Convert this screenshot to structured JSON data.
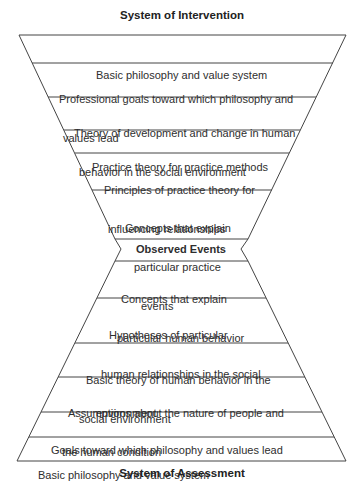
{
  "top_title": "System of Intervention",
  "bottom_title": "System of Assessment",
  "center_label": "Observed Events",
  "intervention_levels": [
    {
      "lines": [
        "Basic philosophy and value system"
      ]
    },
    {
      "lines": [
        "Professional goals toward which philosophy and",
        "values lead"
      ]
    },
    {
      "lines": [
        "Theory of development and change in human",
        "behavior in the social environment"
      ]
    },
    {
      "lines": [
        "Practice theory for practice methods"
      ]
    },
    {
      "lines": [
        "Principles of practice theory for",
        "influencing relationships"
      ]
    },
    {
      "lines": [
        "Concepts that explain",
        "particular practice",
        "events"
      ]
    }
  ],
  "assessment_levels": [
    {
      "lines": [
        "Concepts that explain",
        "particular human behavior"
      ]
    },
    {
      "lines": [
        "Hypotheses of particular",
        "human relationships in the social",
        "environment"
      ]
    },
    {
      "lines": [
        "Basic theory of human behavior in the",
        "social environment"
      ]
    },
    {
      "lines": [
        "Assumptions about the nature of people and",
        "the human condition"
      ]
    },
    {
      "lines": [
        "Goals toward which philosophy and values lead"
      ]
    },
    {
      "lines": [
        "Basic philosophy and value system"
      ]
    }
  ],
  "colors": {
    "line": "#444444",
    "text": "#2e2e2e",
    "background": "#ffffff"
  }
}
